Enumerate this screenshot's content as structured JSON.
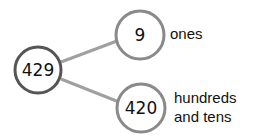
{
  "diagram": {
    "type": "number-bond",
    "whole": {
      "value": "429"
    },
    "parts": [
      {
        "value": "9",
        "label": [
          "ones"
        ]
      },
      {
        "value": "420",
        "label": [
          "hundreds",
          "and tens"
        ]
      }
    ]
  },
  "colors": {
    "whole_stroke": "#555555",
    "part_stroke": "#8a8a8a",
    "connector": "#a0a0a0",
    "text": "#111111"
  }
}
